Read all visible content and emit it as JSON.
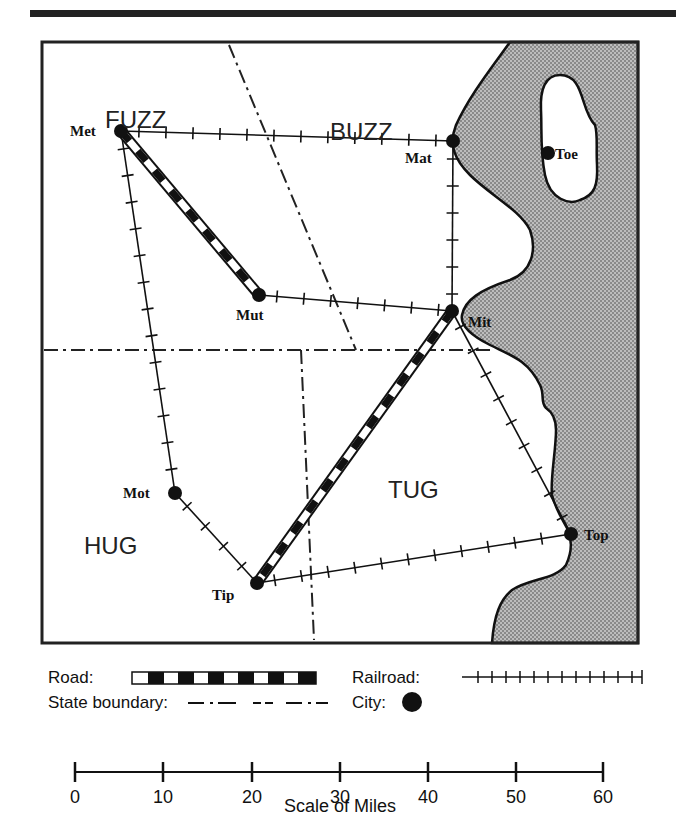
{
  "map": {
    "regions": [
      {
        "name": "FUZZ",
        "x": 105,
        "y": 128
      },
      {
        "name": "BUZZ",
        "x": 330,
        "y": 140
      },
      {
        "name": "HUG",
        "x": 84,
        "y": 554
      },
      {
        "name": "TUG",
        "x": 388,
        "y": 498
      }
    ],
    "cities": [
      {
        "name": "Met",
        "x": 121,
        "y": 131,
        "label_x": 70,
        "label_y": 136
      },
      {
        "name": "Mat",
        "x": 453,
        "y": 141,
        "label_x": 405,
        "label_y": 163
      },
      {
        "name": "Toe",
        "x": 548,
        "y": 153,
        "label_x": 555,
        "label_y": 159
      },
      {
        "name": "Mut",
        "x": 259,
        "y": 295,
        "label_x": 236,
        "label_y": 320
      },
      {
        "name": "Mit",
        "x": 452,
        "y": 311,
        "label_x": 468,
        "label_y": 327
      },
      {
        "name": "Mot",
        "x": 175,
        "y": 493,
        "label_x": 123,
        "label_y": 498
      },
      {
        "name": "Top",
        "x": 571,
        "y": 534,
        "label_x": 584,
        "label_y": 540
      },
      {
        "name": "Tip",
        "x": 257,
        "y": 583,
        "label_x": 212,
        "label_y": 600
      }
    ],
    "roads": [
      [
        "Met",
        "Mut"
      ],
      [
        "Mit",
        "Tip"
      ]
    ],
    "railroads": [
      [
        "Met",
        "Mat"
      ],
      [
        "Met",
        "Mot"
      ],
      [
        "Mat",
        "Mit"
      ],
      [
        "Mut",
        "Mit"
      ],
      [
        "Mot",
        "Tip"
      ],
      [
        "Tip",
        "Top"
      ],
      [
        "Mit",
        "Top"
      ]
    ]
  },
  "legend": {
    "road_label": "Road:",
    "railroad_label": "Railroad:",
    "state_boundary_label": "State boundary:",
    "city_label": "City:"
  },
  "scale": {
    "title": "Scale of Miles",
    "ticks": [
      "0",
      "10",
      "20",
      "30",
      "40",
      "50",
      "60"
    ]
  }
}
